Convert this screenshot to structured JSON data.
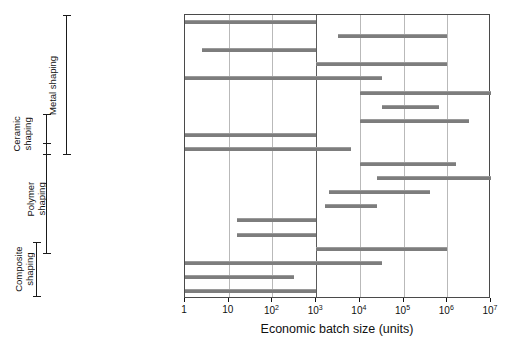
{
  "chart_data": {
    "type": "bar",
    "chart_style": "horizontal-range-bars",
    "title": "",
    "xlabel": "Economic batch size (units)",
    "ylabel": "",
    "xscale": "log10",
    "xlim": [
      1,
      10000000
    ],
    "grid": true,
    "legend": null,
    "xticks": [
      {
        "value": 1,
        "label": "1",
        "mantissa": "1",
        "exponent": ""
      },
      {
        "value": 10,
        "label": "10",
        "mantissa": "10",
        "exponent": ""
      },
      {
        "value": 100,
        "label": "10^2",
        "mantissa": "10",
        "exponent": "2"
      },
      {
        "value": 1000,
        "label": "10^3",
        "mantissa": "10",
        "exponent": "3"
      },
      {
        "value": 10000,
        "label": "10^4",
        "mantissa": "10",
        "exponent": "4"
      },
      {
        "value": 100000,
        "label": "10^5",
        "mantissa": "10",
        "exponent": "5"
      },
      {
        "value": 1000000,
        "label": "10^6",
        "mantissa": "10",
        "exponent": "6"
      },
      {
        "value": 10000000,
        "label": "10^7",
        "mantissa": "10",
        "exponent": "7"
      }
    ],
    "categories": [
      "Sand casting",
      "Die casting",
      "Investment casting",
      "Low pressure casting",
      "Forging",
      "Extrusion",
      "Sheet forming",
      "Powder methods",
      "Electro-machining",
      "Conventional machining",
      "Injection molding",
      "Blow molding",
      "Compression molding",
      "Rotational molding",
      "Thermo-forming",
      "Polymer casting",
      "Resin-transfer molding",
      "Filament winding",
      "Lay-up methods",
      "Vacuum bag"
    ],
    "bars": [
      {
        "category": "Sand casting",
        "start": 1,
        "end": 1000,
        "start_log": 0.0,
        "end_log": 3.0
      },
      {
        "category": "Die casting",
        "start": 3162,
        "end": 1000000,
        "start_log": 3.5,
        "end_log": 6.0
      },
      {
        "category": "Investment casting",
        "start": 2.5,
        "end": 1000,
        "start_log": 0.4,
        "end_log": 3.0
      },
      {
        "category": "Low pressure casting",
        "start": 1000,
        "end": 1000000,
        "start_log": 3.0,
        "end_log": 6.0
      },
      {
        "category": "Forging",
        "start": 1,
        "end": 31623,
        "start_log": 0.0,
        "end_log": 4.5
      },
      {
        "category": "Extrusion",
        "start": 10000,
        "end": 10000000,
        "start_log": 4.0,
        "end_log": 7.0
      },
      {
        "category": "Sheet forming",
        "start": 31623,
        "end": 631000,
        "start_log": 4.5,
        "end_log": 5.8
      },
      {
        "category": "Powder methods",
        "start": 10000,
        "end": 3162000,
        "start_log": 4.0,
        "end_log": 6.5
      },
      {
        "category": "Electro-machining",
        "start": 1,
        "end": 1000,
        "start_log": 0.0,
        "end_log": 3.0
      },
      {
        "category": "Conventional machining",
        "start": 1,
        "end": 6310,
        "start_log": 0.0,
        "end_log": 3.8
      },
      {
        "category": "Injection molding",
        "start": 10000,
        "end": 1580000,
        "start_log": 4.0,
        "end_log": 6.2
      },
      {
        "category": "Blow molding",
        "start": 25100,
        "end": 10000000,
        "start_log": 4.4,
        "end_log": 7.0
      },
      {
        "category": "Compression molding",
        "start": 1995,
        "end": 398000,
        "start_log": 3.3,
        "end_log": 5.6
      },
      {
        "category": "Rotational molding",
        "start": 1585,
        "end": 25100,
        "start_log": 3.2,
        "end_log": 4.4
      },
      {
        "category": "Thermo-forming",
        "start": 15.8,
        "end": 1000,
        "start_log": 1.2,
        "end_log": 3.0
      },
      {
        "category": "Polymer casting",
        "start": 15.8,
        "end": 1000,
        "start_log": 1.2,
        "end_log": 3.0
      },
      {
        "category": "Resin-transfer molding",
        "start": 1000,
        "end": 1000000,
        "start_log": 3.0,
        "end_log": 6.0
      },
      {
        "category": "Filament winding",
        "start": 1,
        "end": 31623,
        "start_log": 0.0,
        "end_log": 4.5
      },
      {
        "category": "Lay-up methods",
        "start": 1,
        "end": 316,
        "start_log": 0.0,
        "end_log": 2.5
      },
      {
        "category": "Vacuum bag",
        "start": 1,
        "end": 1000,
        "start_log": 0.0,
        "end_log": 3.0
      }
    ],
    "groups": [
      {
        "name": "Metal shaping",
        "label": "Metal shaping",
        "first": "Sand casting",
        "last": "Conventional machining"
      },
      {
        "name": "Ceramic shaping",
        "label": "Ceramic\nshaping",
        "first": "Powder methods",
        "last": "Conventional machining"
      },
      {
        "name": "Polymer shaping",
        "label": "Polymer\nshaping",
        "first": "Conventional machining",
        "last": "Resin-transfer molding"
      },
      {
        "name": "Composite shaping",
        "label": "Composite\nshaping",
        "first": "Resin-transfer molding",
        "last": "Vacuum bag"
      }
    ],
    "colors": {
      "bar": "#7d7d7d",
      "bar_highlight": "#9a9a9a",
      "frame": "#4a4a4a",
      "gridline": "#b9b9b9",
      "gridline_major": "#5a5a5a",
      "text": "#111111",
      "background": "#ffffff"
    }
  },
  "geometry": {
    "plot_left": 184,
    "plot_right": 490,
    "plot_top": 14,
    "plot_bottom": 298,
    "row_height": 14.2,
    "decade_px": 43.71
  }
}
